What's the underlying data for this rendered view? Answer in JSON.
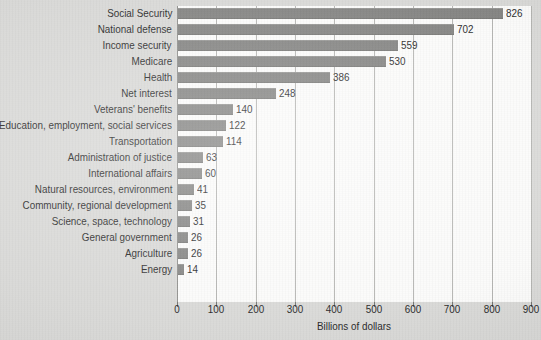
{
  "chart_data": {
    "type": "bar",
    "orientation": "horizontal",
    "title": "",
    "xlabel": "Billions of dollars",
    "ylabel": "",
    "xlim": [
      0,
      900
    ],
    "xticks": [
      0,
      100,
      200,
      300,
      400,
      500,
      600,
      700,
      800,
      900
    ],
    "grid": true,
    "legend": "none",
    "bar_color": "#7f7f7d",
    "categories": [
      "Social Security",
      "National defense",
      "Income security",
      "Medicare",
      "Health",
      "Net interest",
      "Veterans' benefits",
      "Education, employment, social services",
      "Transportation",
      "Administration of justice",
      "International affairs",
      "Natural resources, environment",
      "Community, regional development",
      "Science, space, technology",
      "General government",
      "Agriculture",
      "Energy"
    ],
    "values": [
      826,
      702,
      559,
      530,
      386,
      248,
      140,
      122,
      114,
      63,
      60,
      41,
      35,
      31,
      26,
      26,
      14
    ],
    "value_labels": [
      "826",
      "702",
      "559",
      "530",
      "386",
      "248",
      "140",
      "122",
      "114",
      "63",
      "60",
      "41",
      "35",
      "31",
      "26",
      "26",
      "14"
    ],
    "xtick_labels": [
      "0",
      "100",
      "200",
      "300",
      "400",
      "500",
      "600",
      "700",
      "800",
      "900"
    ]
  }
}
